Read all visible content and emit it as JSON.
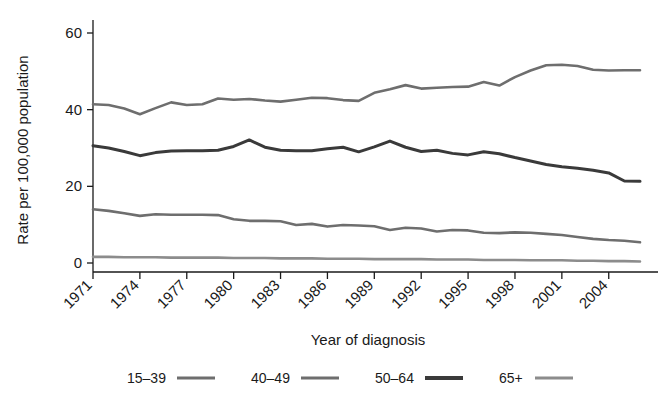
{
  "chart_data": {
    "type": "line",
    "title": "",
    "xlabel": "Year of diagnosis",
    "ylabel": "Rate per 100,000 population",
    "grid": false,
    "legend_position": "bottom",
    "xlim": [
      1971,
      2006
    ],
    "ylim": [
      0,
      62
    ],
    "yticks": [
      0,
      20,
      40,
      60
    ],
    "ytick_labels": [
      "0",
      "20",
      "40",
      "60"
    ],
    "xticks": [
      1971,
      1974,
      1977,
      1980,
      1983,
      1986,
      1989,
      1992,
      1995,
      1998,
      2001,
      2004
    ],
    "xtick_labels": [
      "1971",
      "1974",
      "1977",
      "1980",
      "1983",
      "1986",
      "1989",
      "1992",
      "1995",
      "1998",
      "2001",
      "2004"
    ],
    "x": [
      1971,
      1972,
      1973,
      1974,
      1975,
      1976,
      1977,
      1978,
      1979,
      1980,
      1981,
      1982,
      1983,
      1984,
      1985,
      1986,
      1987,
      1988,
      1989,
      1990,
      1991,
      1992,
      1993,
      1994,
      1995,
      1996,
      1997,
      1998,
      1999,
      2000,
      2001,
      2002,
      2003,
      2004,
      2005,
      2006
    ],
    "series": [
      {
        "name": "15–39",
        "color": "#6e6e6e",
        "width": 2.6,
        "values": [
          41.4,
          41.2,
          40.3,
          38.8,
          40.4,
          41.9,
          41.2,
          41.4,
          42.9,
          42.6,
          42.8,
          42.4,
          42.1,
          42.6,
          43.1,
          43.0,
          42.5,
          42.3,
          44.4,
          45.3,
          46.4,
          45.5,
          45.7,
          45.9,
          46.0,
          47.2,
          46.3,
          48.5,
          50.2,
          51.6,
          51.7,
          51.4,
          50.4,
          50.2,
          50.3,
          50.3
        ]
      },
      {
        "name": "40–49",
        "color": "#6e6e6e",
        "width": 2.6,
        "values": [
          14.0,
          13.6,
          13.0,
          12.3,
          12.7,
          12.6,
          12.6,
          12.6,
          12.5,
          11.4,
          11.0,
          11.0,
          10.9,
          9.9,
          10.2,
          9.5,
          9.9,
          9.8,
          9.6,
          8.6,
          9.2,
          9.0,
          8.2,
          8.6,
          8.5,
          7.9,
          7.8,
          8.0,
          7.9,
          7.6,
          7.3,
          6.8,
          6.3,
          6.0,
          5.8,
          5.4
        ]
      },
      {
        "name": "50–64",
        "color": "#3a3a3a",
        "width": 3.0,
        "values": [
          30.6,
          30.0,
          29.1,
          28.0,
          28.8,
          29.2,
          29.3,
          29.3,
          29.4,
          30.4,
          32.1,
          30.2,
          29.4,
          29.3,
          29.3,
          29.8,
          30.2,
          29.0,
          30.3,
          31.8,
          30.2,
          29.1,
          29.4,
          28.6,
          28.2,
          29.0,
          28.5,
          27.5,
          26.6,
          25.7,
          25.1,
          24.7,
          24.2,
          23.5,
          21.4,
          21.3
        ]
      },
      {
        "name": "65+",
        "color": "#8c8c8c",
        "width": 2.6,
        "values": [
          1.6,
          1.6,
          1.5,
          1.5,
          1.5,
          1.4,
          1.4,
          1.4,
          1.4,
          1.3,
          1.3,
          1.3,
          1.2,
          1.2,
          1.2,
          1.1,
          1.1,
          1.1,
          1.0,
          1.0,
          1.0,
          1.0,
          0.9,
          0.9,
          0.9,
          0.8,
          0.8,
          0.8,
          0.7,
          0.7,
          0.7,
          0.6,
          0.6,
          0.5,
          0.5,
          0.4
        ]
      }
    ],
    "legend": [
      {
        "label": "15–39",
        "color": "#6e6e6e",
        "width": 3
      },
      {
        "label": "40–49",
        "color": "#6e6e6e",
        "width": 3
      },
      {
        "label": "50–64",
        "color": "#3a3a3a",
        "width": 4
      },
      {
        "label": "65+",
        "color": "#8c8c8c",
        "width": 3
      }
    ]
  }
}
